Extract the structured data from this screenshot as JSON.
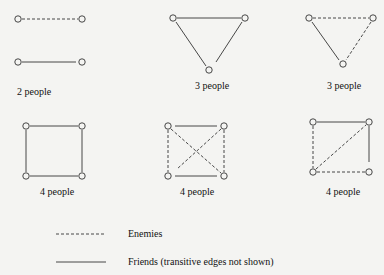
{
  "colors": {
    "background": "#f4f4f2",
    "stroke": "#333333"
  },
  "graphs": [
    {
      "label": "2 people"
    },
    {
      "label": "3 people"
    },
    {
      "label": "3 people"
    },
    {
      "label": "4 people"
    },
    {
      "label": "4 people"
    },
    {
      "label": "4 people"
    }
  ],
  "legend": {
    "enemies": "Enemies",
    "friends": "Friends (transitive edges not shown)"
  }
}
